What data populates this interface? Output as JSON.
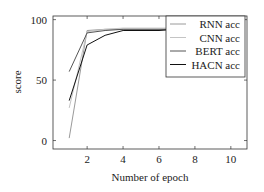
{
  "chart_data": {
    "type": "line",
    "title": "",
    "xlabel": "Number of epoch",
    "ylabel": "score",
    "xlim": [
      0.1,
      10.9
    ],
    "ylim": [
      -7,
      103
    ],
    "xticks": [
      2,
      4,
      6,
      8,
      10
    ],
    "yticks": [
      0,
      50,
      100
    ],
    "grid": false,
    "legend_position": "upper right",
    "x": [
      1,
      2,
      3,
      4,
      5,
      6,
      7,
      8,
      9,
      10
    ],
    "series": [
      {
        "name": "RNN acc",
        "color": "#9a9a9a",
        "values": [
          2,
          91,
          92,
          92,
          92,
          92,
          92,
          92,
          92,
          92
        ]
      },
      {
        "name": "CNN acc",
        "color": "#c4c4c4",
        "values": [
          27,
          90,
          92,
          93,
          93,
          93,
          93,
          93,
          93,
          93
        ]
      },
      {
        "name": "BERT acc",
        "color": "#555555",
        "values": [
          57,
          89,
          91,
          92,
          92,
          92,
          92,
          92,
          92,
          92
        ]
      },
      {
        "name": "HACN acc",
        "color": "#111111",
        "values": [
          33,
          79,
          87,
          91,
          91,
          91,
          92,
          92,
          92,
          92
        ]
      }
    ]
  }
}
